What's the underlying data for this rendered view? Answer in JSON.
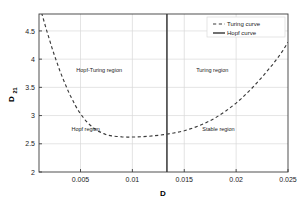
{
  "chart_data": {
    "type": "line",
    "title": "",
    "xlabel": "D",
    "ylabel": "D",
    "ylabel_sub": "21",
    "xlim": [
      0.001,
      0.025
    ],
    "ylim": [
      2,
      4.8
    ],
    "grid": true,
    "xticks": [
      0.005,
      0.01,
      0.015,
      0.02,
      0.025
    ],
    "xtick_labels": [
      "0.005",
      "0.01",
      "0.015",
      "0.02",
      "0.025"
    ],
    "yticks": [
      2,
      2.5,
      3,
      3.5,
      4,
      4.5
    ],
    "ytick_labels": [
      "2",
      "2.5",
      "3",
      "3.5",
      "4",
      "4.5"
    ],
    "series": [
      {
        "name": "Turing curve",
        "style": "dashed",
        "color": "#3a3a3a",
        "x": [
          0.00125,
          0.0015,
          0.00175,
          0.002,
          0.00225,
          0.0025,
          0.00275,
          0.003,
          0.00325,
          0.0035,
          0.00375,
          0.004,
          0.00425,
          0.0045,
          0.00475,
          0.005,
          0.00525,
          0.0055,
          0.00575,
          0.006,
          0.00625,
          0.0065,
          0.00675,
          0.007,
          0.00725,
          0.0075,
          0.00775,
          0.008,
          0.00825,
          0.0085,
          0.00875,
          0.009,
          0.00925,
          0.0095,
          0.00975,
          0.01,
          0.0105,
          0.011,
          0.0115,
          0.012,
          0.0125,
          0.013,
          0.0135,
          0.014,
          0.0145,
          0.015,
          0.0155,
          0.016,
          0.0165,
          0.017,
          0.0175,
          0.018,
          0.0185,
          0.019,
          0.0195,
          0.02,
          0.0205,
          0.021,
          0.0215,
          0.022,
          0.0225,
          0.023,
          0.0235,
          0.024,
          0.0245,
          0.025
        ],
        "y": [
          4.82,
          4.66,
          4.5,
          4.35,
          4.2,
          4.06,
          3.93,
          3.8,
          3.68,
          3.57,
          3.46,
          3.36,
          3.27,
          3.18,
          3.1,
          3.03,
          2.97,
          2.91,
          2.86,
          2.82,
          2.78,
          2.75,
          2.72,
          2.7,
          2.68,
          2.66,
          2.65,
          2.64,
          2.635,
          2.63,
          2.625,
          2.622,
          2.62,
          2.619,
          2.619,
          2.62,
          2.622,
          2.626,
          2.632,
          2.64,
          2.65,
          2.662,
          2.676,
          2.692,
          2.71,
          2.73,
          2.76,
          2.79,
          2.825,
          2.865,
          2.91,
          2.96,
          3.02,
          3.08,
          3.15,
          3.22,
          3.3,
          3.39,
          3.48,
          3.58,
          3.68,
          3.79,
          3.9,
          4.02,
          4.15,
          4.3
        ]
      },
      {
        "name": "Hopf curve",
        "style": "solid",
        "color": "#4d4d4d",
        "vertical_x": 0.01333
      }
    ],
    "annotations": [
      {
        "text": "Hopf-Turing region",
        "x": 0.0068,
        "y": 3.78
      },
      {
        "text": "Turing region",
        "x": 0.0177,
        "y": 3.78
      },
      {
        "text": "Hopf region",
        "x": 0.0055,
        "y": 2.73
      },
      {
        "text": "Stable region",
        "x": 0.0183,
        "y": 2.72
      }
    ],
    "legend": {
      "position": "top-right",
      "entries": [
        {
          "label": "Turing curve",
          "style": "dashed"
        },
        {
          "label": "Hopf curve",
          "style": "solid"
        }
      ]
    }
  },
  "colors": {
    "axis": "#3d3d3d",
    "grid": "#d9d9d9",
    "turing_curve": "#3a3a3a",
    "hopf_curve": "#4d4d4d",
    "text": "#1a1a1a",
    "background": "#ffffff"
  }
}
